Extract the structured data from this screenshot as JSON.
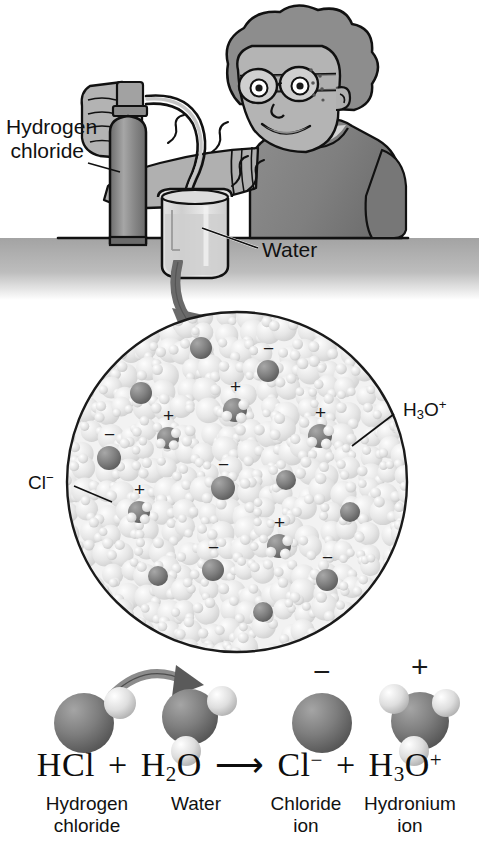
{
  "figure": {
    "width": 479,
    "height": 854
  },
  "colors": {
    "ink": "#111111",
    "outline": "#1a1a1a",
    "cylinder_dark": "#7b7b7b",
    "cylinder_light": "#9d9d9d",
    "skin": "#b5b5b5",
    "hair": "#8f8f8f",
    "shirt": "#8a8a8a",
    "table": "#9a9a9a",
    "beaker_glass": "#d7d7d7",
    "water_fill": "#cccccc",
    "solution_bg": "#f0f0f0",
    "water_molecule": "#dcdcdc",
    "ion_dark": "#6f6f6f",
    "atom_dark": "#767676",
    "atom_light": "#d8d8d8",
    "arrow_gray": "#6e6e6e",
    "background": "#ffffff"
  },
  "scene": {
    "labels": [
      {
        "id": "hydrogen-chloride",
        "line1": "Hydrogen",
        "line2": "chloride"
      },
      {
        "id": "water",
        "line1": "Water",
        "line2": ""
      }
    ]
  },
  "zoom_circle": {
    "labels": {
      "chloride": "Cl",
      "chloride_charge": "−",
      "hydronium": "H",
      "hydronium_sub": "3",
      "hydronium_o": "O",
      "hydronium_charge": "+"
    },
    "ions": [
      {
        "id": "ion-1",
        "charge": "",
        "cx": 201,
        "cy": 348,
        "r": 11
      },
      {
        "id": "ion-2",
        "charge": "−",
        "cx": 268,
        "cy": 371,
        "r": 11
      },
      {
        "id": "ion-3",
        "charge": "",
        "cx": 141,
        "cy": 393,
        "r": 11
      },
      {
        "id": "ion-4",
        "charge": "+",
        "cx": 235,
        "cy": 410,
        "r": 12
      },
      {
        "id": "ion-5",
        "charge": "+",
        "cx": 168,
        "cy": 438,
        "r": 11
      },
      {
        "id": "ion-6",
        "charge": "+",
        "cx": 320,
        "cy": 436,
        "r": 12
      },
      {
        "id": "ion-7",
        "charge": "−",
        "cx": 109,
        "cy": 458,
        "r": 12
      },
      {
        "id": "ion-8",
        "charge": "−",
        "cx": 223,
        "cy": 488,
        "r": 12
      },
      {
        "id": "ion-9",
        "charge": "",
        "cx": 286,
        "cy": 480,
        "r": 10
      },
      {
        "id": "ion-10",
        "charge": "+",
        "cx": 139,
        "cy": 512,
        "r": 11
      },
      {
        "id": "ion-11",
        "charge": "",
        "cx": 350,
        "cy": 512,
        "r": 10
      },
      {
        "id": "ion-12",
        "charge": "+",
        "cx": 279,
        "cy": 546,
        "r": 12
      },
      {
        "id": "ion-13",
        "charge": "−",
        "cx": 213,
        "cy": 570,
        "r": 11
      },
      {
        "id": "ion-14",
        "charge": "",
        "cx": 158,
        "cy": 576,
        "r": 10
      },
      {
        "id": "ion-15",
        "charge": "−",
        "cx": 327,
        "cy": 580,
        "r": 11
      },
      {
        "id": "ion-16",
        "charge": "",
        "cx": 263,
        "cy": 612,
        "r": 10
      }
    ]
  },
  "equation": {
    "terms": [
      {
        "id": "hcl",
        "formula_html": "HCl"
      },
      {
        "id": "plus-1",
        "formula_html": "+"
      },
      {
        "id": "h2o",
        "formula_html": "H<sub>2</sub>O"
      },
      {
        "id": "arrow",
        "formula_html": "⟶"
      },
      {
        "id": "cl-ion",
        "formula_html": "Cl<sup>−</sup>"
      },
      {
        "id": "plus-2",
        "formula_html": "+"
      },
      {
        "id": "h3o-ion",
        "formula_html": "H<sub>3</sub>O<sup>+</sup>"
      }
    ],
    "plain": "HCl + H2O ⟶ Cl− + H3O+",
    "captions": [
      {
        "id": "caption-hydrogen-chloride",
        "line1": "Hydrogen",
        "line2": "chloride"
      },
      {
        "id": "caption-water",
        "line1": "Water",
        "line2": ""
      },
      {
        "id": "caption-chloride-ion",
        "line1": "Chloride",
        "line2": "ion"
      },
      {
        "id": "caption-hydronium-ion",
        "line1": "Hydronium",
        "line2": "ion"
      }
    ],
    "charges": {
      "chloride": "−",
      "hydronium": "+"
    }
  }
}
